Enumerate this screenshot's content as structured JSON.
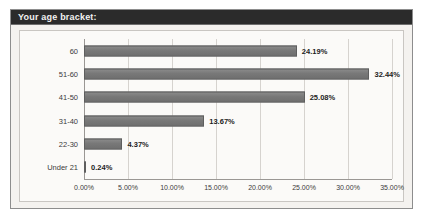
{
  "panel": {
    "title": "Your age bracket:"
  },
  "chart_data": {
    "type": "bar",
    "orientation": "horizontal",
    "title": "Your age bracket:",
    "xlabel": "",
    "ylabel": "",
    "xlim": [
      0,
      35
    ],
    "grid": true,
    "legend": false,
    "categories": [
      "Under 21",
      "22-30",
      "31-40",
      "41-50",
      "51-60",
      "60"
    ],
    "values": [
      0.24,
      4.37,
      13.67,
      25.08,
      32.44,
      24.19
    ],
    "data_labels": [
      "0.24%",
      "4.37%",
      "13.67%",
      "25.08%",
      "32.44%",
      "24.19%"
    ],
    "xticks": [
      0,
      5,
      10,
      15,
      20,
      25,
      30,
      35
    ],
    "xtick_labels": [
      "0.00%",
      "5.00%",
      "10.00%",
      "15.00%",
      "20.00%",
      "25.00%",
      "30.00%",
      "35.00%"
    ],
    "bar_color": "#7d7d7d",
    "plot_background": "#fbfaf8",
    "panel_background": "#f4f2ef",
    "title_bar_color": "#2b2b2b",
    "grid_color": "#d6d3cf"
  }
}
